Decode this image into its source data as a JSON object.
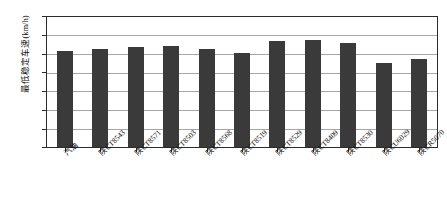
{
  "chart_data": {
    "type": "bar",
    "title": "",
    "xlabel": "",
    "ylabel": "最低稳定车速(km/h)",
    "ylim": [
      0,
      35
    ],
    "ytick_values": [
      35,
      30,
      25,
      20,
      15,
      10,
      5,
      0
    ],
    "ytick_labels": [
      "35",
      "30",
      "25",
      "20",
      "15",
      "10",
      "5",
      "0"
    ],
    "grid": "horizontal",
    "legend": "none",
    "bar_color": "#3a3a3a",
    "categories": [
      "汽油",
      "陕CT8543",
      "陕CT8571",
      "陕CT8503",
      "陕CT8568",
      "陕CT8519",
      "陕CT8529",
      "陕CT8409",
      "陕CT8530",
      "陕CU6029",
      "陕CR5070"
    ],
    "values": [
      25.9,
      26.5,
      27.0,
      27.2,
      26.5,
      25.4,
      28.6,
      28.7,
      27.9,
      22.6,
      23.7
    ]
  }
}
